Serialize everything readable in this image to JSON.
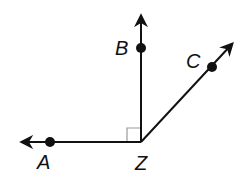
{
  "diagram": {
    "type": "angles",
    "vertex": {
      "label": "Z",
      "x": 141,
      "y": 142
    },
    "rays": [
      {
        "name": "ZA",
        "point_label": "A",
        "point": {
          "x": 50,
          "y": 142
        },
        "tip": {
          "x": 20,
          "y": 142
        }
      },
      {
        "name": "ZB",
        "point_label": "B",
        "point": {
          "x": 141,
          "y": 48
        },
        "tip": {
          "x": 141,
          "y": 14
        }
      },
      {
        "name": "ZC",
        "point_label": "C",
        "point": {
          "x": 212,
          "y": 67
        },
        "tip": {
          "x": 234,
          "y": 42
        }
      }
    ],
    "right_angle_marker": {
      "between": [
        "ZA",
        "ZB"
      ],
      "size": 14
    },
    "labels": {
      "A": "A",
      "B": "B",
      "C": "C",
      "Z": "Z"
    },
    "colors": {
      "stroke": "#111111",
      "marker": "#9a9a9a",
      "background": "#ffffff"
    }
  }
}
